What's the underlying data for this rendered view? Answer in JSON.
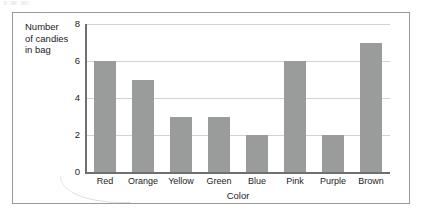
{
  "chart_data": {
    "type": "bar",
    "title": "",
    "categories": [
      "Red",
      "Orange",
      "Yellow",
      "Green",
      "Blue",
      "Pink",
      "Purple",
      "Brown"
    ],
    "values": [
      6,
      5,
      3,
      3,
      2,
      6,
      2,
      7
    ],
    "xlabel": "Color",
    "ylabel": "Number of candies in bag",
    "ylabel_lines": [
      "Number",
      "of candies",
      "in bag"
    ],
    "yticks": [
      0,
      2,
      4,
      6,
      8
    ],
    "ylim": [
      0,
      8
    ],
    "grid": true,
    "legend": false,
    "bar_color": "#9a9b9b",
    "grid_color": "#d2d2d2",
    "axis_color": "#6f6f6f",
    "frame_color": "#9a9a9a",
    "text_color": "#1c1c1c"
  }
}
